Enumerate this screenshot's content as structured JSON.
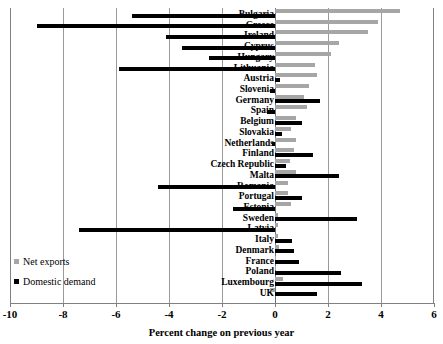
{
  "chart_data": {
    "type": "bar",
    "orientation": "horizontal",
    "title": "",
    "xlabel": "Percent change on previous year",
    "ylabel": "",
    "xlim": [
      -10,
      6
    ],
    "xticks": [
      -10,
      -8,
      -6,
      -4,
      -2,
      0,
      2,
      4,
      6
    ],
    "xtick_labels": [
      "-10",
      "-8",
      "-6",
      "-4",
      "-2",
      "0",
      "2",
      "4",
      "6"
    ],
    "grid": true,
    "legend_position": "bottom-left",
    "categories": [
      "Bulgaria",
      "Greece",
      "Ireland",
      "Cyprus",
      "Hungary",
      "Lithuania",
      "Austria",
      "Slovenia",
      "Germany",
      "Spain",
      "Belgium",
      "Slovakia",
      "Netherlands",
      "Finland",
      "Czech Republic",
      "Malta",
      "Romania",
      "Portugal",
      "Estonia",
      "Sweden",
      "Latvia",
      "Italy",
      "Denmark",
      "France",
      "Poland",
      "Luxembourg",
      "UK"
    ],
    "series": [
      {
        "name": "Net exports",
        "color": "#a6a6a6",
        "values": [
          4.7,
          3.9,
          3.5,
          2.4,
          2.1,
          1.5,
          1.6,
          1.3,
          1.1,
          1.2,
          0.8,
          0.6,
          0.8,
          0.7,
          0.55,
          0.8,
          0.5,
          0.5,
          0.6,
          0.1,
          0.1,
          0.1,
          0.15,
          0.0,
          0.05,
          0.3,
          -0.2
        ]
      },
      {
        "name": "Domestic demand",
        "color": "#000000",
        "values": [
          -5.4,
          -9.0,
          -4.1,
          -3.5,
          -2.5,
          -5.9,
          0.2,
          -0.2,
          1.7,
          -0.3,
          1.0,
          0.25,
          -0.1,
          1.45,
          0.4,
          2.4,
          -4.4,
          1.0,
          -1.6,
          3.1,
          -7.4,
          0.65,
          0.7,
          0.9,
          2.5,
          3.3,
          1.6
        ]
      }
    ]
  },
  "legend": {
    "items": [
      {
        "label": "Net exports",
        "color": "#a6a6a6"
      },
      {
        "label": "Domestic demand",
        "color": "#000000"
      }
    ]
  },
  "axis": {
    "title": "Percent change on previous year",
    "ticks": [
      "-10",
      "-8",
      "-6",
      "-4",
      "-2",
      "0",
      "2",
      "4",
      "6"
    ]
  }
}
